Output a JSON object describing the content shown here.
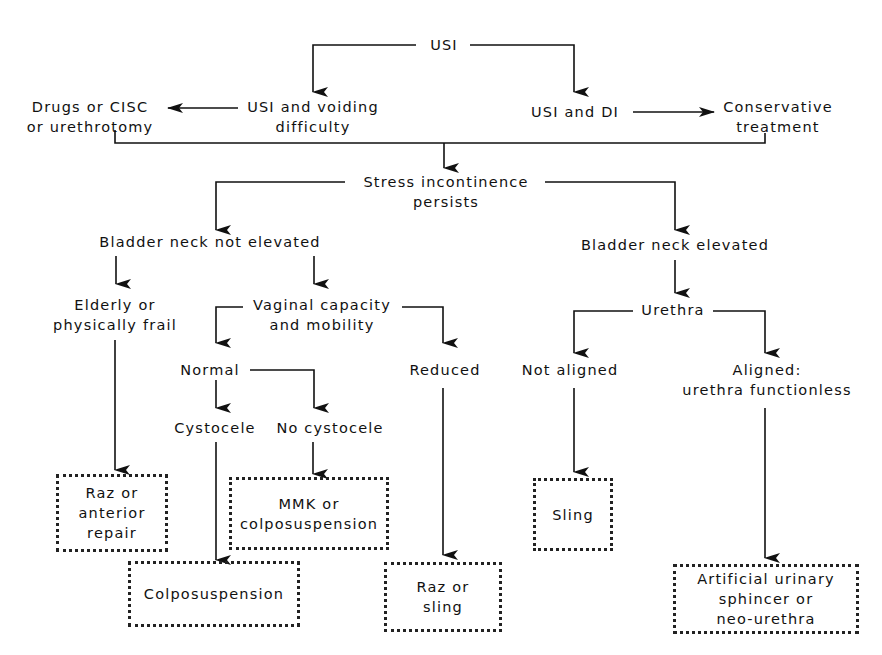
{
  "diagram": {
    "type": "flowchart",
    "root": "USI",
    "nodes": {
      "usi": [
        "USI"
      ],
      "usi_voiding": [
        "USI and voiding",
        "difficulty"
      ],
      "drugs": [
        "Drugs or CISC",
        "or  urethrotomy"
      ],
      "usi_di": [
        "USI and DI"
      ],
      "conservative": [
        "Conservative",
        "treatment"
      ],
      "stress": [
        "Stress incontinence",
        "persists"
      ],
      "bn_not_elevated": [
        "Bladder neck not elevated"
      ],
      "bn_elevated": [
        "Bladder neck elevated"
      ],
      "elderly": [
        "Elderly or",
        "physically frail"
      ],
      "vaginal": [
        "Vaginal capacity",
        "and mobility"
      ],
      "normal": [
        "Normal"
      ],
      "reduced": [
        "Reduced"
      ],
      "cystocele": [
        "Cystocele"
      ],
      "no_cystocele": [
        "No cystocele"
      ],
      "urethra": [
        "Urethra"
      ],
      "not_aligned": [
        "Not aligned"
      ],
      "aligned": [
        "Aligned:",
        "urethra functionless"
      ]
    },
    "outcomes": {
      "raz_anterior": [
        "Raz  or",
        "anterior",
        "repair"
      ],
      "mmk": [
        "MMK or",
        "colposuspension"
      ],
      "colposuspension": [
        "Colposuspension"
      ],
      "raz_sling": [
        "Raz  or",
        "sling"
      ],
      "sling": [
        "Sling"
      ],
      "artificial": [
        "Artificial urinary",
        "sphincer or",
        "neo-urethra"
      ]
    },
    "edges": [
      [
        "usi",
        "usi_voiding"
      ],
      [
        "usi",
        "usi_di"
      ],
      [
        "usi_voiding",
        "drugs"
      ],
      [
        "usi_di",
        "conservative"
      ],
      [
        "drugs",
        "stress"
      ],
      [
        "conservative",
        "stress"
      ],
      [
        "stress",
        "bn_not_elevated"
      ],
      [
        "stress",
        "bn_elevated"
      ],
      [
        "bn_not_elevated",
        "elderly"
      ],
      [
        "bn_not_elevated",
        "vaginal"
      ],
      [
        "elderly",
        "raz_anterior"
      ],
      [
        "vaginal",
        "normal"
      ],
      [
        "vaginal",
        "reduced"
      ],
      [
        "normal",
        "cystocele"
      ],
      [
        "normal",
        "no_cystocele"
      ],
      [
        "cystocele",
        "colposuspension"
      ],
      [
        "no_cystocele",
        "mmk"
      ],
      [
        "reduced",
        "raz_sling"
      ],
      [
        "bn_elevated",
        "urethra"
      ],
      [
        "urethra",
        "not_aligned"
      ],
      [
        "urethra",
        "aligned"
      ],
      [
        "not_aligned",
        "sling"
      ],
      [
        "aligned",
        "artificial"
      ]
    ]
  }
}
